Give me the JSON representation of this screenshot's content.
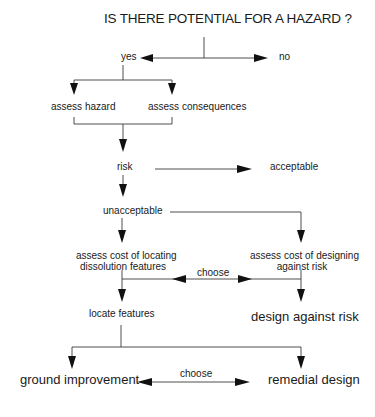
{
  "diagram": {
    "title": "IS THERE POTENTIAL FOR A HAZARD ?",
    "nodes": {
      "yes": "yes",
      "no": "no",
      "assess_hazard": "assess hazard",
      "assess_consequences": "assess consequences",
      "risk": "risk",
      "acceptable": "acceptable",
      "unacceptable": "unacceptable",
      "assess_cost_locating_line1": "assess cost of locating",
      "assess_cost_locating_line2": "dissolution features",
      "assess_cost_designing_line1": "assess cost of designing",
      "assess_cost_designing_line2": "against risk",
      "choose_upper": "choose",
      "locate_features": "locate features",
      "design_against_risk": "design against risk",
      "ground_improvement": "ground improvement",
      "choose_lower": "choose",
      "remedial_design": "remedial design"
    },
    "colors": {
      "line": "#3a3a3a",
      "arrow": "#111111",
      "text": "#1a1a1a",
      "background": "#ffffff"
    }
  }
}
